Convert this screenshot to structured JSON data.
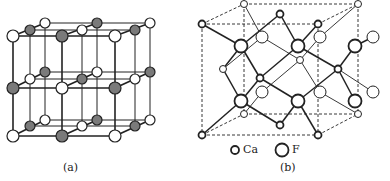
{
  "figure": {
    "panel_a": {
      "caption": "(a)"
    },
    "panel_b": {
      "caption": "(b)",
      "legend": [
        {
          "symbol": "small-circle",
          "label": "Ca"
        },
        {
          "symbol": "large-circle",
          "label": "F"
        }
      ]
    }
  },
  "colors": {
    "line": "#222222",
    "shaded_atom": "#7a7a7a",
    "open_atom": "#ffffff"
  }
}
